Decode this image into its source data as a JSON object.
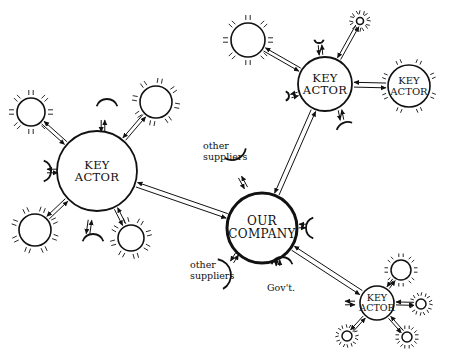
{
  "diagram": {
    "type": "stakeholder-network",
    "center": {
      "id": "our-company",
      "label_line1": "OUR",
      "label_line2": "COMPANY"
    },
    "key_actors": [
      {
        "id": "key-actor-left",
        "label_line1": "KEY",
        "label_line2": "ACTOR"
      },
      {
        "id": "key-actor-top",
        "label_line1": "KEY",
        "label_line2": "ACTOR"
      },
      {
        "id": "key-actor-top-right",
        "label_line1": "KEY",
        "label_line2": "ACTOR"
      },
      {
        "id": "key-actor-bottom-right",
        "label_line1": "KEY",
        "label_line2": "ACTOR"
      }
    ],
    "arcs": {
      "other_suppliers_top": "other\nsuppliers",
      "other_suppliers_top_line1": "other",
      "other_suppliers_top_line2": "suppliers",
      "other_suppliers_bottom_line1": "other",
      "other_suppliers_bottom_line2": "suppliers",
      "government": "Gov't."
    },
    "edges": [
      {
        "from": "key-actor-left",
        "to": "our-company",
        "style": "double-arrow"
      },
      {
        "from": "key-actor-top",
        "to": "our-company",
        "style": "double-arrow"
      },
      {
        "from": "key-actor-bottom-right",
        "to": "our-company",
        "style": "double-arrow"
      },
      {
        "from": "key-actor-top",
        "to": "key-actor-top-right",
        "style": "double-arrow"
      }
    ]
  }
}
